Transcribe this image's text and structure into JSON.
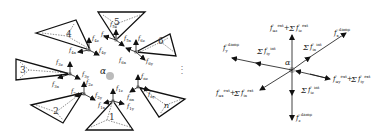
{
  "left_panel": {
    "center_particle": "α",
    "particles": [
      {
        "id": "1",
        "label": "1"
      },
      {
        "id": "2",
        "label": "2"
      },
      {
        "id": "3",
        "label": "3"
      },
      {
        "id": "4",
        "label": "4"
      },
      {
        "id": "5",
        "label": "5"
      },
      {
        "id": "6",
        "label": "6"
      },
      {
        "id": "n",
        "label": "n"
      }
    ],
    "ellipsis": "⋮",
    "force_labels": {
      "f1x": "f1x",
      "f1y": "f1y",
      "f1z": "f1z",
      "f2x": "f2x",
      "f2y": "f2y",
      "f2z": "f2z",
      "f3x": "f3x",
      "f3y": "f3y",
      "f3z": "f3z",
      "f4x": "f4x",
      "f4y": "f4y",
      "f4z": "f4z",
      "f5x": "f5x",
      "f5y": "f5y",
      "f5z": "f5z",
      "f6x": "f6x",
      "f6y": "f6y",
      "f6z": "f6z",
      "fnx": "fnx",
      "fny": "fny",
      "fnz": "fnz"
    }
  },
  "right_panel": {
    "center_particle": "α",
    "labels": {
      "top": "f_αz^ext + Σ_{j=1}^{nc} f_iz^ext",
      "upper_right": "f_x^damp",
      "upper_mid": "Σ_{j=1}^{nc} f_ix^int",
      "left_upper": "f_y^damp",
      "left_mid": "Σ_{j=1}^{nc} f_iy^int",
      "right": "f_αy^ext + Σ_{j=1}^{nc} f_iy^ext",
      "lower_left": "f_αx^ext + Σ_{j=1}^{nc} f_ix^ext",
      "lower_mid": "Σ_{j=1}^{nc} f_iz^int",
      "bottom": "f_z^damp"
    }
  }
}
